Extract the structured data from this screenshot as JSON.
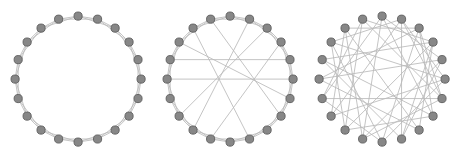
{
  "figure": {
    "title": "",
    "background_color": "#ffffff",
    "width": 462,
    "height": 157,
    "panel_count": 3
  },
  "style": {
    "node_fill": "#878787",
    "node_stroke": "#5d5d5d",
    "node_radius": 4.1,
    "edge_color": "#b9b9b9",
    "edge_width": 0.85
  },
  "chart_data": {
    "type": "diagram",
    "diagram_kind": "watts-strogatz-small-world-ring-graphs",
    "title": "",
    "xlabel": "",
    "ylabel": "",
    "legend": [],
    "annotations": [],
    "shared": {
      "node_count": 20,
      "layout": "circular",
      "node_order": "clockwise from top",
      "ring_start_angle_deg": -90,
      "radius_px": 63,
      "node_marker": "filled-circle"
    },
    "panels": [
      {
        "index": 0,
        "name": "regular-lattice",
        "label": "",
        "center": [
          78,
          79
        ],
        "radius": 63,
        "node_count": 20,
        "lattice_k": 4,
        "rewiring_probability": 0.0,
        "edge_count": 40,
        "long_range_chord_count": 0,
        "edges": [
          [
            0,
            1
          ],
          [
            1,
            2
          ],
          [
            2,
            3
          ],
          [
            3,
            4
          ],
          [
            4,
            5
          ],
          [
            5,
            6
          ],
          [
            6,
            7
          ],
          [
            7,
            8
          ],
          [
            8,
            9
          ],
          [
            9,
            10
          ],
          [
            10,
            11
          ],
          [
            11,
            12
          ],
          [
            12,
            13
          ],
          [
            13,
            14
          ],
          [
            14,
            15
          ],
          [
            15,
            16
          ],
          [
            16,
            17
          ],
          [
            17,
            18
          ],
          [
            18,
            19
          ],
          [
            19,
            0
          ],
          [
            0,
            2
          ],
          [
            1,
            3
          ],
          [
            2,
            4
          ],
          [
            3,
            5
          ],
          [
            4,
            6
          ],
          [
            5,
            7
          ],
          [
            6,
            8
          ],
          [
            7,
            9
          ],
          [
            8,
            10
          ],
          [
            9,
            11
          ],
          [
            10,
            12
          ],
          [
            11,
            13
          ],
          [
            12,
            14
          ],
          [
            13,
            15
          ],
          [
            14,
            16
          ],
          [
            15,
            17
          ],
          [
            16,
            18
          ],
          [
            17,
            19
          ],
          [
            18,
            0
          ],
          [
            19,
            1
          ]
        ]
      },
      {
        "index": 1,
        "name": "small-world",
        "label": "",
        "center": [
          230,
          79
        ],
        "radius": 63,
        "node_count": 20,
        "lattice_k": 4,
        "rewiring_probability": 0.1,
        "edge_count": 40,
        "long_range_chord_count": 8,
        "edges": [
          [
            0,
            1
          ],
          [
            1,
            2
          ],
          [
            2,
            3
          ],
          [
            3,
            4
          ],
          [
            4,
            5
          ],
          [
            5,
            6
          ],
          [
            6,
            7
          ],
          [
            7,
            8
          ],
          [
            8,
            9
          ],
          [
            9,
            10
          ],
          [
            10,
            11
          ],
          [
            11,
            12
          ],
          [
            12,
            13
          ],
          [
            13,
            15
          ],
          [
            14,
            15
          ],
          [
            15,
            16
          ],
          [
            16,
            17
          ],
          [
            17,
            18
          ],
          [
            18,
            19
          ],
          [
            19,
            0
          ],
          [
            0,
            2
          ],
          [
            1,
            3
          ],
          [
            2,
            4
          ],
          [
            3,
            5
          ],
          [
            4,
            6
          ],
          [
            5,
            7
          ],
          [
            6,
            8
          ],
          [
            7,
            9
          ],
          [
            8,
            10
          ],
          [
            9,
            11
          ],
          [
            10,
            12
          ],
          [
            11,
            13
          ],
          [
            12,
            14
          ],
          [
            14,
            16
          ],
          [
            15,
            17
          ],
          [
            16,
            18
          ],
          [
            17,
            19
          ],
          [
            18,
            0
          ],
          [
            19,
            1
          ],
          [
            13,
            14
          ],
          [
            2,
            13
          ],
          [
            4,
            16
          ],
          [
            6,
            17
          ],
          [
            1,
            12
          ],
          [
            5,
            15
          ],
          [
            9,
            18
          ],
          [
            3,
            11
          ],
          [
            7,
            19
          ]
        ]
      },
      {
        "index": 2,
        "name": "random",
        "label": "",
        "center": [
          382,
          79
        ],
        "radius": 63,
        "node_count": 20,
        "lattice_k": 4,
        "rewiring_probability": 1.0,
        "edge_count": 40,
        "long_range_chord_count": 34,
        "edges": [
          [
            0,
            7
          ],
          [
            0,
            11
          ],
          [
            0,
            14
          ],
          [
            0,
            4
          ],
          [
            1,
            9
          ],
          [
            1,
            13
          ],
          [
            1,
            6
          ],
          [
            1,
            17
          ],
          [
            2,
            10
          ],
          [
            2,
            15
          ],
          [
            2,
            6
          ],
          [
            2,
            18
          ],
          [
            3,
            12
          ],
          [
            3,
            8
          ],
          [
            3,
            16
          ],
          [
            3,
            19
          ],
          [
            4,
            11
          ],
          [
            4,
            15
          ],
          [
            4,
            9
          ],
          [
            5,
            13
          ],
          [
            5,
            17
          ],
          [
            5,
            10
          ],
          [
            5,
            1
          ],
          [
            6,
            14
          ],
          [
            6,
            19
          ],
          [
            7,
            12
          ],
          [
            7,
            16
          ],
          [
            7,
            2
          ],
          [
            8,
            15
          ],
          [
            8,
            18
          ],
          [
            9,
            16
          ],
          [
            9,
            3
          ],
          [
            10,
            17
          ],
          [
            10,
            14
          ],
          [
            11,
            18
          ],
          [
            11,
            6
          ],
          [
            12,
            19
          ],
          [
            12,
            17
          ],
          [
            13,
            18
          ],
          [
            14,
            19
          ]
        ]
      }
    ]
  }
}
